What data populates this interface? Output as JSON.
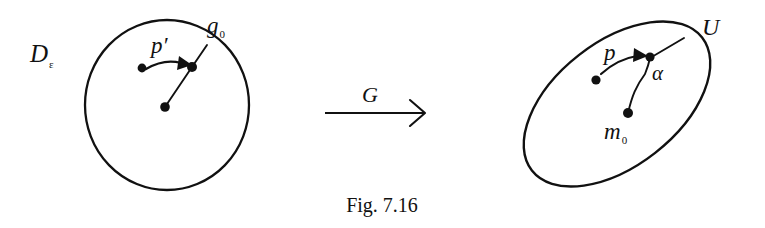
{
  "figure": {
    "caption": "Fig. 7.16",
    "background_color": "#ffffff",
    "ink_color": "#111111",
    "left_panel": {
      "region_label": "D",
      "region_label_subscript": "ε",
      "boundary_shape": "circle",
      "boundary_point_label": "g",
      "boundary_point_subscript": "0",
      "motion_label": "p′",
      "dots": [
        "interior-source",
        "boundary-target",
        "center"
      ]
    },
    "map_arrow": {
      "label": "G",
      "direction": "right"
    },
    "right_panel": {
      "boundary_shape": "ellipse",
      "boundary_point_label": "U",
      "image_point_label": "α",
      "center_point_label": "m",
      "center_point_subscript": "0",
      "motion_label": "p",
      "dots": [
        "interior-source",
        "boundary-target",
        "center"
      ]
    }
  }
}
